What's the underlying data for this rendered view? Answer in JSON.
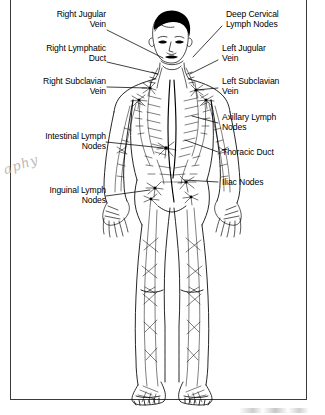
{
  "diagram": {
    "line_color": "#000000",
    "frame_color": "#3a3a3a",
    "background": "#ffffff"
  },
  "watermark": {
    "text": "aphy"
  },
  "labels_left": [
    {
      "id": "right-jugular-vein",
      "text": "Right Jugular\nVein"
    },
    {
      "id": "right-lymphatic-duct",
      "text": "Right Lymphatic\nDuct"
    },
    {
      "id": "right-subclavian-vein",
      "text": "Right Subclavian\nVein"
    },
    {
      "id": "intestinal-lymph-nodes",
      "text": "Intestinal Lymph\nNodes"
    },
    {
      "id": "inguinal-lymph-nodes",
      "text": "Inguinal Lymph\nNodes"
    }
  ],
  "labels_right": [
    {
      "id": "deep-cervical-lymph-nodes",
      "text": "Deep Cervical\nLymph Nodes"
    },
    {
      "id": "left-jugular-vein",
      "text": "Left Jugular\nVein"
    },
    {
      "id": "left-subclavian-vein",
      "text": "Left Subclavian\nVein"
    },
    {
      "id": "axillary-lymph-nodes",
      "text": "Axillary Lymph\nNodes"
    },
    {
      "id": "thoracic-duct",
      "text": "Thoracic Duct"
    },
    {
      "id": "iliac-nodes",
      "text": "Iliac Nodes"
    }
  ]
}
